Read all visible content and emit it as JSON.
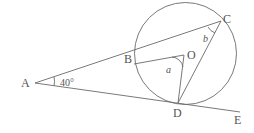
{
  "diagram": {
    "type": "circle-geometry",
    "points": {
      "A": "A",
      "B": "B",
      "C": "C",
      "D": "D",
      "E": "E",
      "O": "O"
    },
    "angles": {
      "at_A": "40°",
      "angle_BOD": "a",
      "angle_BCD": "b"
    },
    "segments": [
      "AC",
      "AE",
      "BO",
      "OD",
      "CD",
      "circle"
    ],
    "colors": {
      "line": "#6a6a6a",
      "text": "#555555",
      "background": "#ffffff"
    }
  }
}
